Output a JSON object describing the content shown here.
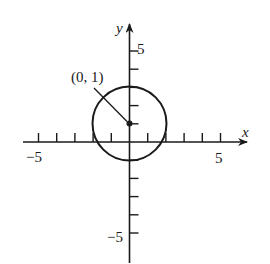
{
  "figure": {
    "title": "",
    "point_label": "(0, 1)",
    "x_axis_label": "x",
    "y_axis_label": "y",
    "x_tick_labels": {
      "neg": "−5",
      "pos": "5"
    },
    "y_tick_labels": {
      "neg": "−5",
      "pos": "5"
    },
    "colors": {
      "ink": "#1a1a1a",
      "background": "#ffffff"
    }
  },
  "chart_data": {
    "type": "diagram",
    "title": "",
    "circle": {
      "center": [
        0,
        1
      ],
      "radius": 2
    },
    "marked_point": {
      "x": 0,
      "y": 1,
      "label": "(0, 1)"
    },
    "xlabel": "x",
    "ylabel": "y",
    "xlim": [
      -6,
      6
    ],
    "ylim": [
      -6,
      6
    ],
    "x_ticks": [
      -5,
      -4,
      -3,
      -2,
      -1,
      1,
      2,
      3,
      4,
      5
    ],
    "y_ticks": [
      -5,
      -4,
      -3,
      -2,
      -1,
      1,
      2,
      3,
      4,
      5
    ],
    "x_tick_labels_shown": [
      "-5",
      "5"
    ],
    "y_tick_labels_shown": [
      "5",
      "-5"
    ],
    "grid": false
  }
}
